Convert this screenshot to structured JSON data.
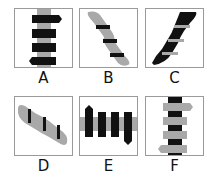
{
  "puzzle": {
    "options": [
      {
        "id": "A",
        "label": "A",
        "description": "vertical grey band with four black horizontal bars; top bar arrow right, bottom bar arrow left"
      },
      {
        "id": "B",
        "label": "B",
        "description": "grey twisted rope diagonal top-left to bottom-right with three black horizontal stripes"
      },
      {
        "id": "C",
        "label": "C",
        "description": "black twisted rope diagonal bottom-left to top-right with grey horizontal stripes"
      },
      {
        "id": "D",
        "label": "D",
        "description": "grey twisted rope diagonal shallow slope with three black vertical stripes"
      },
      {
        "id": "E",
        "label": "E",
        "description": "horizontal grey band with four black vertical bars; left bar arrow up, right bar arrow down"
      },
      {
        "id": "F",
        "label": "F",
        "description": "vertical black band with four grey horizontal bars; top bar arrow right, bottom bar arrow left"
      }
    ]
  },
  "colors": {
    "grey": "#a9a9a9",
    "black": "#111111",
    "border": "#9a9a9a"
  }
}
